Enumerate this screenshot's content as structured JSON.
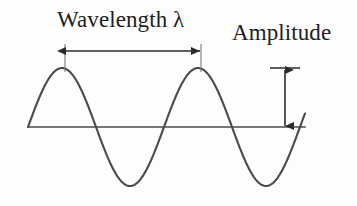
{
  "figure": {
    "background_color": "#fdfdfd",
    "stroke_color": "#4a4a4a",
    "annotation_color": "#2b2b2b",
    "text_color": "#1d1d1d",
    "width": 357,
    "height": 206
  },
  "labels": {
    "wavelength": "Wavelength λ",
    "amplitude": "Amplitude"
  },
  "chart_data": {
    "type": "line",
    "title": "",
    "xlabel": "",
    "ylabel": "",
    "grid": false,
    "legend": null,
    "series": [
      {
        "name": "sine wave",
        "waveform": "sine",
        "amplitude": 59,
        "wavelength": 136,
        "phase_start_x": 28,
        "baseline_y": 127,
        "x_start": 28,
        "x_end": 305,
        "cycles": 2,
        "peaks_x": [
          65,
          201
        ],
        "peaks_y": [
          68,
          68
        ],
        "troughs_x": [
          133,
          269
        ],
        "troughs_y": [
          190,
          190
        ],
        "zero_crossings_x": [
          28,
          100,
          168,
          236,
          304
        ]
      }
    ],
    "annotations": [
      {
        "name": "wavelength-measure",
        "label": "Wavelength λ",
        "kind": "double-arrow-horizontal",
        "from_x": 65,
        "to_x": 201,
        "arrow_y": 51,
        "tick_top_y": 44,
        "tick_bottom_y": 72,
        "value": 136
      },
      {
        "name": "amplitude-measure",
        "label": "Amplitude",
        "kind": "double-arrow-vertical",
        "x": 285,
        "from_y": 68,
        "to_y": 127,
        "cap_x_start": 270,
        "cap_x_end": 300,
        "value": 59
      }
    ],
    "baseline": {
      "name": "equilibrium-axis",
      "y": 127,
      "x_start": 28,
      "x_end": 305
    }
  }
}
